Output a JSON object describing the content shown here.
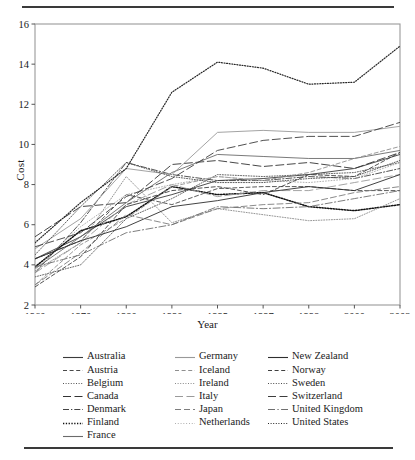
{
  "figure": {
    "ylabel": "Cost",
    "xlabel": "Year"
  },
  "chart_data": {
    "type": "line",
    "title": "",
    "xlabel": "Year",
    "ylabel": "Cost",
    "categories": [
      "1960",
      "1970",
      "1980",
      "1990",
      "1995",
      "1997",
      "1998",
      "2000",
      "2002"
    ],
    "x_tick_labels": [
      "1960",
      "1970",
      "1980",
      "1990",
      "1995",
      "1997",
      "1998",
      "2000",
      "2002"
    ],
    "y_tick_labels": [
      "2",
      "4",
      "6",
      "8",
      "10",
      "12",
      "14",
      "16"
    ],
    "ylim": [
      2,
      16
    ],
    "y_ticks": [
      2,
      4,
      6,
      8,
      10,
      12,
      14,
      16
    ],
    "grid": false,
    "legend_position": "below-plot-3-columns",
    "series": [
      {
        "name": "Australia",
        "style": "solid",
        "color": "#3b3b3b",
        "width": 0.9,
        "values": [
          4.3,
          5.4,
          6.9,
          7.5,
          8.2,
          8.3,
          8.5,
          8.8,
          9.5
        ]
      },
      {
        "name": "Austria",
        "style": "dashed",
        "color": "#4a4a4a",
        "width": 0.9,
        "values": [
          4.3,
          5.2,
          7.5,
          7.0,
          7.8,
          7.9,
          7.9,
          7.7,
          7.7
        ]
      },
      {
        "name": "Belgium",
        "style": "dotted",
        "color": "#555555",
        "width": 0.9,
        "values": [
          3.4,
          4.0,
          6.3,
          7.3,
          8.5,
          8.4,
          8.5,
          8.6,
          9.1
        ]
      },
      {
        "name": "Canada",
        "style": "longdash",
        "color": "#333333",
        "width": 0.9,
        "values": [
          5.4,
          6.9,
          7.1,
          9.0,
          9.2,
          8.9,
          9.1,
          8.8,
          9.6
        ]
      },
      {
        "name": "Denmark",
        "style": "dashdot",
        "color": "#444444",
        "width": 0.9,
        "values": [
          3.6,
          6.1,
          9.1,
          8.5,
          8.2,
          8.2,
          8.4,
          8.3,
          8.8
        ]
      },
      {
        "name": "Finland",
        "style": "thickdot",
        "color": "#111111",
        "width": 1.5,
        "values": [
          3.9,
          5.7,
          6.4,
          7.9,
          7.5,
          7.6,
          6.9,
          6.7,
          7.0
        ]
      },
      {
        "name": "France",
        "style": "solid",
        "color": "#6b6b6b",
        "width": 0.9,
        "values": [
          3.8,
          5.4,
          7.1,
          8.6,
          9.5,
          9.4,
          9.3,
          9.3,
          9.7
        ]
      },
      {
        "name": "Germany",
        "style": "solid",
        "color": "#999999",
        "width": 0.9,
        "values": [
          4.8,
          6.3,
          8.8,
          8.5,
          10.6,
          10.7,
          10.6,
          10.6,
          10.9
        ]
      },
      {
        "name": "Iceland",
        "style": "dashed",
        "color": "#8f8f8f",
        "width": 0.9,
        "values": [
          3.0,
          5.0,
          6.3,
          7.9,
          8.4,
          8.2,
          8.6,
          9.3,
          9.9
        ]
      },
      {
        "name": "Ireland",
        "style": "dotted",
        "color": "#8a8a8a",
        "width": 0.9,
        "values": [
          3.7,
          5.1,
          8.4,
          6.1,
          6.8,
          6.5,
          6.2,
          6.3,
          7.3
        ]
      },
      {
        "name": "Italy",
        "style": "longdash",
        "color": "#9a9a9a",
        "width": 0.9,
        "values": [
          3.6,
          5.1,
          7.0,
          8.0,
          7.4,
          7.7,
          7.7,
          8.1,
          8.5
        ]
      },
      {
        "name": "Japan",
        "style": "dashlong",
        "color": "#7d7d7d",
        "width": 0.9,
        "values": [
          3.0,
          4.6,
          6.5,
          6.0,
          6.8,
          7.0,
          7.1,
          7.6,
          7.9
        ]
      },
      {
        "name": "Netherlands",
        "style": "thindot",
        "color": "#a8a8a8",
        "width": 0.9,
        "values": [
          3.8,
          5.9,
          7.5,
          8.0,
          8.4,
          8.2,
          8.1,
          8.3,
          9.1
        ]
      },
      {
        "name": "New Zealand",
        "style": "solid",
        "color": "#2e2e2e",
        "width": 0.9,
        "values": [
          4.3,
          5.2,
          5.9,
          6.9,
          7.2,
          7.6,
          7.9,
          7.7,
          8.5
        ]
      },
      {
        "name": "Norway",
        "style": "dashed",
        "color": "#3f3f3f",
        "width": 0.9,
        "values": [
          2.9,
          4.4,
          7.0,
          7.7,
          7.9,
          7.5,
          8.5,
          8.4,
          9.6
        ]
      },
      {
        "name": "Sweden",
        "style": "dotted",
        "color": "#4c4c4c",
        "width": 0.9,
        "values": [
          4.5,
          6.9,
          9.1,
          8.4,
          8.1,
          8.1,
          8.3,
          8.4,
          9.2
        ]
      },
      {
        "name": "Switzerland",
        "style": "longdash",
        "color": "#3d3d3d",
        "width": 0.9,
        "values": [
          4.9,
          5.6,
          7.4,
          8.3,
          9.7,
          10.2,
          10.4,
          10.4,
          11.1
        ]
      },
      {
        "name": "United Kingdom",
        "style": "dashdotlong",
        "color": "#6f6f6f",
        "width": 0.9,
        "values": [
          3.9,
          4.5,
          5.6,
          6.0,
          6.9,
          6.8,
          6.9,
          7.3,
          7.7
        ]
      },
      {
        "name": "United States",
        "style": "dotted",
        "color": "#262626",
        "width": 1.2,
        "values": [
          5.1,
          7.1,
          8.8,
          12.6,
          14.1,
          13.8,
          13.0,
          13.1,
          14.9
        ]
      }
    ]
  },
  "legend": {
    "columns": [
      {
        "items": [
          {
            "label": "Australia",
            "style": "solid",
            "color": "#3b3b3b"
          },
          {
            "label": "Austria",
            "style": "dashed",
            "color": "#4a4a4a"
          },
          {
            "label": "Belgium",
            "style": "dotted",
            "color": "#555555"
          },
          {
            "label": "Canada",
            "style": "longdash",
            "color": "#333333"
          },
          {
            "label": "Denmark",
            "style": "dashdot",
            "color": "#444444"
          },
          {
            "label": "Finland",
            "style": "thickdot",
            "color": "#111111"
          },
          {
            "label": "France",
            "style": "solid",
            "color": "#6b6b6b"
          }
        ]
      },
      {
        "items": [
          {
            "label": "Germany",
            "style": "solid",
            "color": "#999999"
          },
          {
            "label": "Iceland",
            "style": "dashed",
            "color": "#8f8f8f"
          },
          {
            "label": "Ireland",
            "style": "dotted",
            "color": "#8a8a8a"
          },
          {
            "label": "Italy",
            "style": "longdash",
            "color": "#9a9a9a"
          },
          {
            "label": "Japan",
            "style": "dashlong",
            "color": "#7d7d7d"
          },
          {
            "label": "Netherlands",
            "style": "thindot",
            "color": "#a8a8a8"
          }
        ]
      },
      {
        "items": [
          {
            "label": "New Zealand",
            "style": "solid",
            "color": "#2e2e2e"
          },
          {
            "label": "Norway",
            "style": "dashed",
            "color": "#3f3f3f"
          },
          {
            "label": "Sweden",
            "style": "dotted",
            "color": "#4c4c4c"
          },
          {
            "label": "Switzerland",
            "style": "longdash",
            "color": "#3d3d3d"
          },
          {
            "label": "United Kingdom",
            "style": "dashdotlong",
            "color": "#6f6f6f"
          },
          {
            "label": "United States",
            "style": "dotted",
            "color": "#262626"
          }
        ]
      }
    ]
  }
}
